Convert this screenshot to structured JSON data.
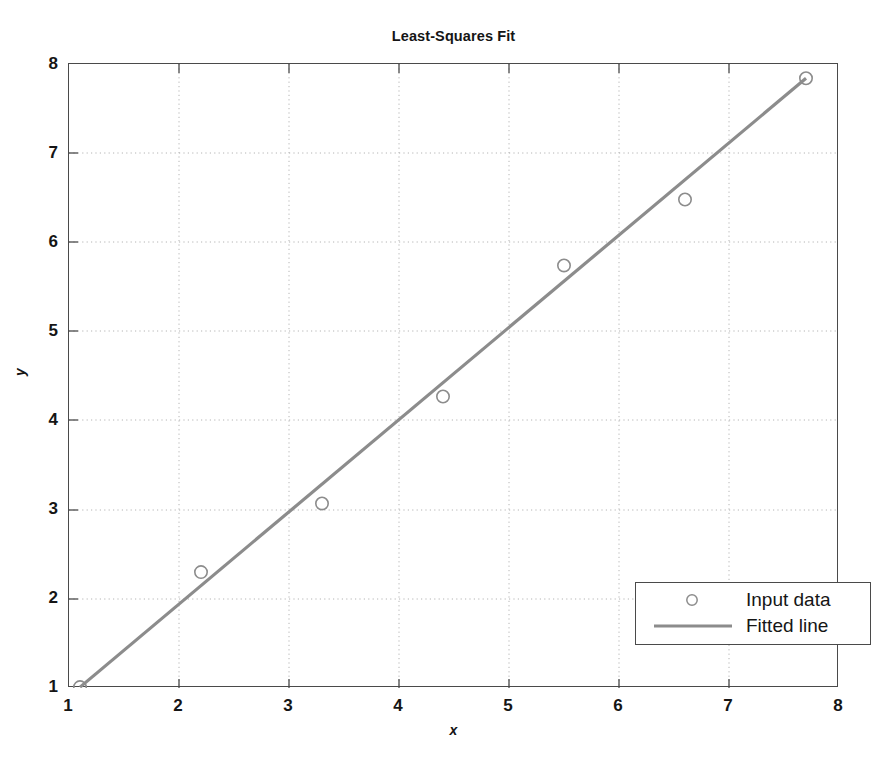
{
  "chart_data": {
    "type": "scatter",
    "title": "Least-Squares Fit",
    "xlabel": "x",
    "ylabel": "y",
    "xlim": [
      1,
      8
    ],
    "ylim": [
      1,
      8
    ],
    "xticks": [
      "1",
      "2",
      "3",
      "4",
      "5",
      "6",
      "7",
      "8"
    ],
    "yticks": [
      "1",
      "2",
      "3",
      "4",
      "5",
      "6",
      "7",
      "8"
    ],
    "xtick_values": [
      1,
      2,
      3,
      4,
      5,
      6,
      7,
      8
    ],
    "ytick_values": [
      1,
      2,
      3,
      4,
      5,
      6,
      7,
      8
    ],
    "grid": true,
    "grid_style": "dotted",
    "grid_color": "#b4b4b4",
    "legend_position": "lower right",
    "series": [
      {
        "name": "Input data",
        "type": "scatter",
        "marker": "circle-open",
        "color": "#8c8c8c",
        "x": [
          1.1,
          2.2,
          3.3,
          4.4,
          5.5,
          6.6,
          7.7
        ],
        "y": [
          1.01,
          2.3,
          3.07,
          4.27,
          5.74,
          6.48,
          7.84
        ]
      },
      {
        "name": "Fitted line",
        "type": "line",
        "color": "#8c8c8c",
        "linewidth": 3.2,
        "x": [
          1.1,
          7.7
        ],
        "y": [
          1.01,
          7.84
        ],
        "slope": 1.035,
        "intercept": -0.13
      }
    ]
  },
  "legend": {
    "entries": [
      {
        "label": "Input data",
        "marker": "circle-open"
      },
      {
        "label": "Fitted line",
        "marker": "line"
      }
    ]
  },
  "axes": {
    "frame_color": "#4a4a4a"
  }
}
